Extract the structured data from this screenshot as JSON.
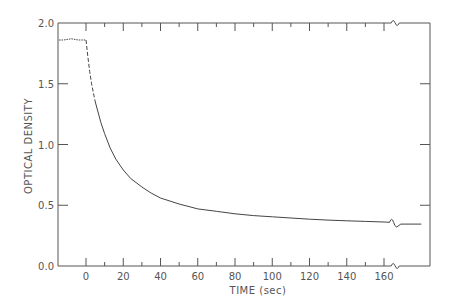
{
  "chart_data": {
    "type": "line",
    "title": "",
    "xlabel": "TIME (sec)",
    "ylabel": "OPTICAL DENSITY",
    "xlim": [
      -16,
      180
    ],
    "ylim": [
      0.0,
      2.0
    ],
    "x_ticks": [
      0,
      20,
      40,
      60,
      80,
      100,
      120,
      140,
      160
    ],
    "x_tick_labels": [
      "0",
      "20",
      "40",
      "60",
      "80",
      "100",
      "120",
      "140",
      "160"
    ],
    "x_minor_ticks": [
      10,
      30,
      50,
      70,
      90,
      110,
      130,
      150
    ],
    "y_ticks": [
      0.0,
      0.5,
      1.0,
      1.5,
      2.0
    ],
    "y_tick_labels": [
      "0.0",
      "0.5",
      "1.0",
      "1.5",
      "2.0"
    ],
    "grid": false,
    "legend": null,
    "axis_break": {
      "x_before": 163,
      "x_after": 169
    },
    "series": [
      {
        "name": "baseline (pre-illumination)",
        "style": "dotted",
        "x": [
          -16,
          -12,
          -8,
          -4,
          0
        ],
        "y": [
          1.86,
          1.86,
          1.87,
          1.86,
          1.86
        ]
      },
      {
        "name": "initial decay (dashed)",
        "style": "dashed",
        "x": [
          0,
          1,
          2,
          3,
          4,
          5
        ],
        "y": [
          1.86,
          1.72,
          1.6,
          1.5,
          1.42,
          1.35
        ]
      },
      {
        "name": "decay",
        "style": "solid",
        "x": [
          5,
          8,
          10,
          13,
          16,
          20,
          24,
          30,
          35,
          40,
          50,
          60,
          70,
          80,
          90,
          100,
          110,
          120,
          130,
          140,
          150,
          160,
          163
        ],
        "y": [
          1.35,
          1.18,
          1.09,
          0.97,
          0.88,
          0.79,
          0.72,
          0.65,
          0.6,
          0.56,
          0.51,
          0.47,
          0.45,
          0.43,
          0.415,
          0.405,
          0.395,
          0.385,
          0.378,
          0.372,
          0.367,
          0.362,
          0.36
        ]
      },
      {
        "name": "after break",
        "style": "solid",
        "x": [
          169,
          180
        ],
        "y": [
          0.345,
          0.345
        ]
      }
    ]
  }
}
